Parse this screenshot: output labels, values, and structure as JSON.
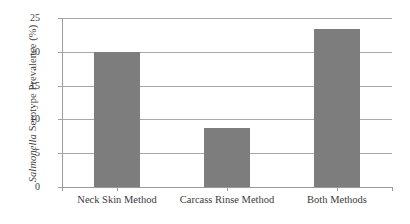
{
  "chart_data": {
    "type": "bar",
    "title": "",
    "xlabel": "",
    "ylabel": "Salmonella Serotype Prevalence (%)",
    "ylabel_italic_part": "Salmonella",
    "ylabel_plain_part": " Serotype Prevalence (%)",
    "categories": [
      "Neck Skin Method",
      "Carcass Rinse Method",
      "Both Methods"
    ],
    "values": [
      20.0,
      8.7,
      23.4
    ],
    "ylim": [
      0,
      25
    ],
    "ytick_labels": [
      "0",
      "5",
      "10",
      "15",
      "20",
      "25"
    ],
    "ytick_values": [
      0,
      5,
      10,
      15,
      20,
      25
    ],
    "grid": "horizontal",
    "legend": "none",
    "bar_color": "#7d7d7d",
    "gridline_color": "#a8a8a8",
    "axis_color": "#9a9a9a",
    "background_color": "#ffffff"
  }
}
